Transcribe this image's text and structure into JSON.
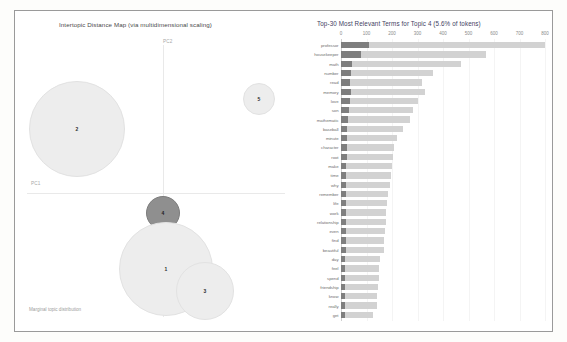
{
  "left_panel": {
    "title": "Intertopic Distance Map (via multidimensional scaling)",
    "axis_x_label": "PC2",
    "axis_y_label": "PC1",
    "marginal_note": "Marginal topic distribution",
    "topics": [
      {
        "label": "2",
        "cx": 62,
        "cy": 118,
        "r": 48,
        "selected": false
      },
      {
        "label": "5",
        "cx": 244,
        "cy": 88,
        "r": 16,
        "selected": false
      },
      {
        "label": "4",
        "cx": 148,
        "cy": 202,
        "r": 17,
        "selected": true
      },
      {
        "label": "1",
        "cx": 151,
        "cy": 258,
        "r": 47,
        "selected": false
      },
      {
        "label": "3",
        "cx": 190,
        "cy": 280,
        "r": 29,
        "selected": false
      }
    ]
  },
  "right_panel": {
    "title": "Top-30 Most Relevant Terms for Topic 4 (5.6% of tokens)"
  },
  "chart_data": {
    "type": "bar",
    "title": "Top-30 Most Relevant Terms for Topic 4 (5.6% of tokens)",
    "orientation": "horizontal",
    "xlabel": "",
    "ylabel": "",
    "xlim": [
      0,
      800
    ],
    "xticks": [
      0,
      100,
      200,
      300,
      400,
      500,
      600,
      700,
      800
    ],
    "grid": true,
    "legend": [
      "Overall term frequency",
      "Estimated term frequency within the selected topic"
    ],
    "legend_position": "none",
    "categories": [
      "professor",
      "housekeeper",
      "math",
      "number",
      "read",
      "memory",
      "love",
      "son",
      "mathematic",
      "baseball",
      "minute",
      "character",
      "root",
      "make",
      "time",
      "why",
      "remember",
      "life",
      "work",
      "relationship",
      "even",
      "find",
      "beautiful",
      "day",
      "feel",
      "spend",
      "friendship",
      "know",
      "really",
      "get"
    ],
    "series": [
      {
        "name": "Overall term frequency",
        "values": [
          800,
          570,
          470,
          360,
          318,
          330,
          300,
          283,
          272,
          243,
          218,
          206,
          202,
          200,
          196,
          193,
          186,
          182,
          178,
          176,
          172,
          170,
          168,
          152,
          150,
          148,
          146,
          143,
          140,
          126
        ]
      },
      {
        "name": "Estimated term frequency within the selected topic",
        "values": [
          110,
          80,
          42,
          40,
          36,
          38,
          34,
          30,
          28,
          25,
          23,
          22,
          22,
          21,
          21,
          20,
          20,
          19,
          19,
          19,
          18,
          18,
          18,
          17,
          17,
          17,
          16,
          16,
          16,
          15
        ]
      }
    ]
  },
  "colors": {
    "bar_overall": "#d2d2d2",
    "bar_topic": "#7e7e7e",
    "circle_selected": "#8f8f8f",
    "circle_default": "#ededed",
    "frame_border": "#9a9a9a"
  }
}
